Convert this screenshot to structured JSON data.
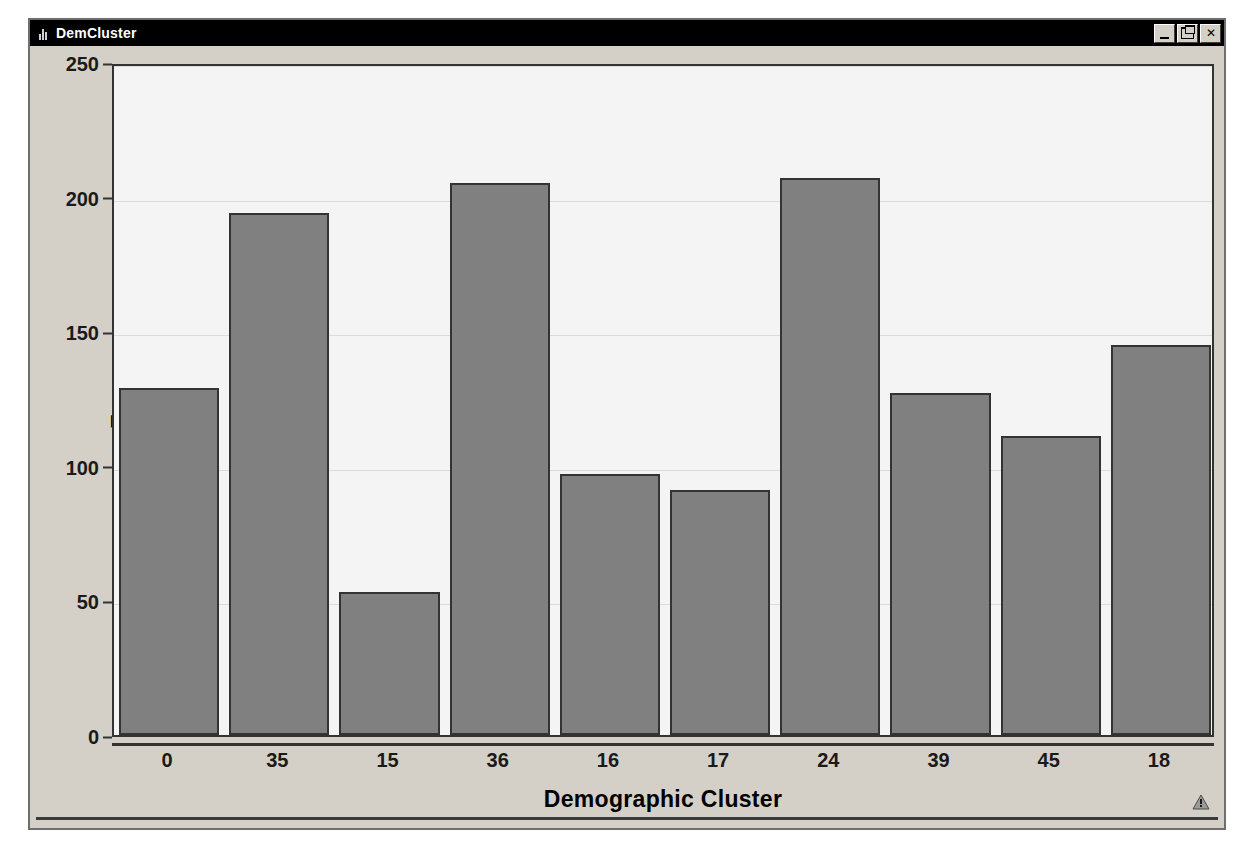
{
  "window": {
    "title": "DemCluster",
    "icon": "bar-chart-icon",
    "controls": [
      {
        "name": "minimize-button",
        "label": "_"
      },
      {
        "name": "restore-button",
        "label": "❐"
      },
      {
        "name": "close-button",
        "label": "✕"
      }
    ]
  },
  "status": {
    "warning_icon": "warning-triangle-icon"
  },
  "chart_data": {
    "type": "bar",
    "title": "",
    "xlabel": "Demographic Cluster",
    "ylabel": "Frequency",
    "categories": [
      "0",
      "35",
      "15",
      "36",
      "16",
      "17",
      "24",
      "39",
      "45",
      "18"
    ],
    "values": [
      129,
      194,
      53,
      205,
      97,
      91,
      207,
      127,
      111,
      145
    ],
    "ylim": [
      0,
      250
    ],
    "yticks": [
      0,
      50,
      100,
      150,
      200,
      250
    ],
    "ytick_labels": [
      "0",
      "50",
      "100",
      "150",
      "200",
      "250"
    ],
    "grid": true,
    "legend": "none",
    "bar_color": "#808080",
    "bar_border_color": "#333333",
    "plot_background": "#f4f4f4",
    "window_background": "#d4d0c8"
  }
}
